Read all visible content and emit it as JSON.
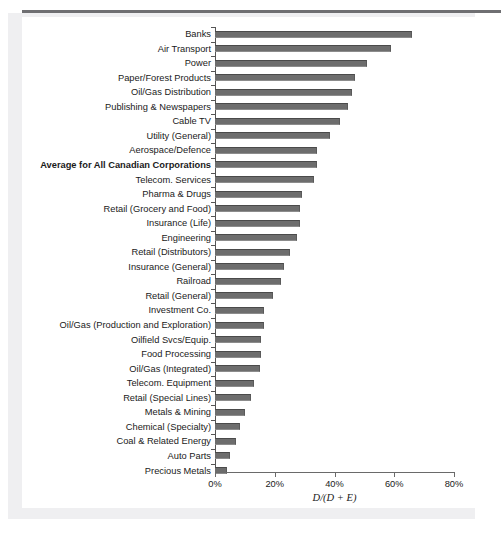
{
  "chart_data": {
    "type": "bar",
    "orientation": "horizontal",
    "title": "",
    "xlabel": "D/(D + E)",
    "ylabel": "",
    "xlim": [
      0,
      80
    ],
    "xticks": [
      "0%",
      "20%",
      "40%",
      "60%",
      "80%"
    ],
    "xtick_values": [
      0,
      20,
      40,
      60,
      80
    ],
    "grid": false,
    "legend": null,
    "highlight_category": "Average for All Canadian Corporations",
    "categories": [
      "Banks",
      "Air Transport",
      "Power",
      "Paper/Forest Products",
      "Oil/Gas Distribution",
      "Publishing & Newspapers",
      "Cable TV",
      "Utility (General)",
      "Aerospace/Defence",
      "Average for All Canadian Corporations",
      "Telecom. Services",
      "Pharma & Drugs",
      "Retail (Grocery and Food)",
      "Insurance (Life)",
      "Engineering",
      "Retail (Distributors)",
      "Insurance (General)",
      "Railroad",
      "Retail (General)",
      "Investment Co.",
      "Oil/Gas (Production and Exploration)",
      "Oilfield Svcs/Equip.",
      "Food Processing",
      "Oil/Gas (Integrated)",
      "Telecom. Equipment",
      "Retail (Special Lines)",
      "Metals & Mining",
      "Chemical (Specialty)",
      "Coal & Related Energy",
      "Auto Parts",
      "Precious Metals"
    ],
    "values": [
      66,
      59,
      51,
      47,
      46,
      44.5,
      42,
      38.5,
      34,
      34,
      33,
      29,
      28.5,
      28.5,
      27.5,
      25,
      23,
      22,
      19.5,
      16.5,
      16.5,
      15.5,
      15.5,
      15,
      13,
      12,
      10,
      8.5,
      7,
      5,
      4
    ]
  },
  "axis": {
    "x_title": "D/(D + E)",
    "tick_labels": [
      "0%",
      "20%",
      "40%",
      "60%",
      "80%"
    ]
  },
  "colors": {
    "bar": "#6d6d6d",
    "bar_edge": "#4a4a4a",
    "axis": "#555555",
    "panel": "#efeff1",
    "rule": "#6f6f72",
    "text": "#1a1a1a"
  }
}
